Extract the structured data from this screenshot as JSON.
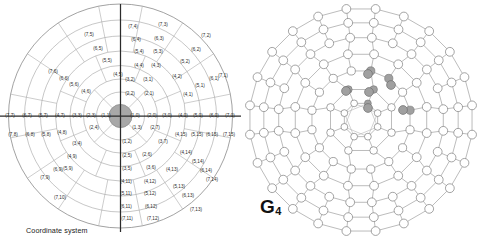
{
  "figure": {
    "panels": [
      {
        "id": "coordinate-system",
        "caption": "Coordinate system"
      },
      {
        "id": "graph",
        "caption": "G",
        "caption_sub": "4"
      }
    ]
  },
  "colors": {
    "background": "#ffffff",
    "stroke": "#6f6f6f",
    "stroke_light": "#bdbdbd",
    "axis": "#2b2b2b",
    "center_fill": "#a8a8a8",
    "node_fill": "#ffffff",
    "node_highlight": "#a0a0a0",
    "text": "#2b2b2b"
  },
  "coordinate_system": {
    "caption": "Coordinate system",
    "center_cell": "(0,0)",
    "ring_count": 7,
    "labels": [
      {
        "t": "(7,4)",
        "x": 133,
        "y": 27
      },
      {
        "t": "(7,3)",
        "x": 163,
        "y": 25
      },
      {
        "t": "(7,5)",
        "x": 89,
        "y": 35
      },
      {
        "t": "(7,2)",
        "x": 206,
        "y": 36
      },
      {
        "t": "(6,4)",
        "x": 136,
        "y": 40
      },
      {
        "t": "(6,3)",
        "x": 159,
        "y": 39
      },
      {
        "t": "(6,5)",
        "x": 98,
        "y": 49
      },
      {
        "t": "(6,2)",
        "x": 196,
        "y": 50
      },
      {
        "t": "(5,4)",
        "x": 139,
        "y": 52
      },
      {
        "t": "(5,3)",
        "x": 158,
        "y": 52
      },
      {
        "t": "(5,5)",
        "x": 107,
        "y": 61
      },
      {
        "t": "(5,2)",
        "x": 185,
        "y": 62
      },
      {
        "t": "(7,6)",
        "x": 53,
        "y": 72
      },
      {
        "t": "(7,1)",
        "x": 223,
        "y": 76
      },
      {
        "t": "(4,4)",
        "x": 139,
        "y": 66
      },
      {
        "t": "(4,3)",
        "x": 156,
        "y": 66
      },
      {
        "t": "(4,5)",
        "x": 118,
        "y": 75
      },
      {
        "t": "(4,2)",
        "x": 177,
        "y": 77
      },
      {
        "t": "(6,6)",
        "x": 64,
        "y": 79
      },
      {
        "t": "(6,1)",
        "x": 214,
        "y": 79
      },
      {
        "t": "(5,6)",
        "x": 74,
        "y": 85
      },
      {
        "t": "(5,1)",
        "x": 200,
        "y": 86
      },
      {
        "t": "(3,2)",
        "x": 130,
        "y": 80
      },
      {
        "t": "(3,1)",
        "x": 148,
        "y": 80
      },
      {
        "t": "(4,6)",
        "x": 86,
        "y": 92
      },
      {
        "t": "(4,1)",
        "x": 188,
        "y": 95
      },
      {
        "t": "(2,2)",
        "x": 130,
        "y": 94
      },
      {
        "t": "(2,1)",
        "x": 149,
        "y": 94
      },
      {
        "t": "(7,7)",
        "x": 10,
        "y": 116
      },
      {
        "t": "(6,7)",
        "x": 27,
        "y": 116
      },
      {
        "t": "(5,7)",
        "x": 43,
        "y": 116
      },
      {
        "t": "(4,7)",
        "x": 60,
        "y": 116
      },
      {
        "t": "(3,3)",
        "x": 77,
        "y": 116
      },
      {
        "t": "(2,3)",
        "x": 91,
        "y": 116
      },
      {
        "t": "(1,1)",
        "x": 106,
        "y": 116
      },
      {
        "t": "(1,0)",
        "x": 135,
        "y": 116
      },
      {
        "t": "(2,0)",
        "x": 152,
        "y": 116
      },
      {
        "t": "(3,0)",
        "x": 167,
        "y": 116
      },
      {
        "t": "(4,0)",
        "x": 183,
        "y": 116
      },
      {
        "t": "(5,0)",
        "x": 198,
        "y": 116
      },
      {
        "t": "(6,0)",
        "x": 214,
        "y": 116
      },
      {
        "t": "(7,0)",
        "x": 230,
        "y": 116
      },
      {
        "t": "(7,8)",
        "x": 13,
        "y": 135
      },
      {
        "t": "(6,8)",
        "x": 30,
        "y": 135
      },
      {
        "t": "(5,8)",
        "x": 46,
        "y": 135
      },
      {
        "t": "(4,8)",
        "x": 62,
        "y": 133
      },
      {
        "t": "(2,4)",
        "x": 94,
        "y": 128
      },
      {
        "t": "(1,3)",
        "x": 137,
        "y": 128
      },
      {
        "t": "(2,7)",
        "x": 155,
        "y": 128
      },
      {
        "t": "(4,15)",
        "x": 181,
        "y": 135
      },
      {
        "t": "(5,15)",
        "x": 197,
        "y": 135
      },
      {
        "t": "(6,15)",
        "x": 212,
        "y": 135
      },
      {
        "t": "(7,15)",
        "x": 229,
        "y": 135
      },
      {
        "t": "(3,4)",
        "x": 77,
        "y": 144
      },
      {
        "t": "(1,2)",
        "x": 127,
        "y": 142
      },
      {
        "t": "(3,7)",
        "x": 163,
        "y": 142
      },
      {
        "t": "(2,5)",
        "x": 127,
        "y": 156
      },
      {
        "t": "(2,6)",
        "x": 147,
        "y": 155
      },
      {
        "t": "(4,9)",
        "x": 72,
        "y": 157
      },
      {
        "t": "(4,14)",
        "x": 186,
        "y": 153
      },
      {
        "t": "(5,14)",
        "x": 198,
        "y": 162
      },
      {
        "t": "(3,5)",
        "x": 127,
        "y": 169
      },
      {
        "t": "(3,6)",
        "x": 151,
        "y": 168
      },
      {
        "t": "(6,9)",
        "x": 58,
        "y": 170
      },
      {
        "t": "(5,9)",
        "x": 68,
        "y": 169
      },
      {
        "t": "(6,14)",
        "x": 206,
        "y": 171
      },
      {
        "t": "(7,9)",
        "x": 45,
        "y": 178
      },
      {
        "t": "(7,14)",
        "x": 212,
        "y": 180
      },
      {
        "t": "(4,11)",
        "x": 126,
        "y": 182
      },
      {
        "t": "(4,12)",
        "x": 150,
        "y": 182
      },
      {
        "t": "(4,13)",
        "x": 172,
        "y": 170
      },
      {
        "t": "(5,13)",
        "x": 179,
        "y": 187
      },
      {
        "t": "(5,11)",
        "x": 126,
        "y": 194
      },
      {
        "t": "(5,12)",
        "x": 150,
        "y": 194
      },
      {
        "t": "(6,13)",
        "x": 188,
        "y": 196
      },
      {
        "t": "(7,10)",
        "x": 60,
        "y": 198
      },
      {
        "t": "(6,11)",
        "x": 126,
        "y": 207
      },
      {
        "t": "(6,12)",
        "x": 151,
        "y": 207
      },
      {
        "t": "(7,13)",
        "x": 196,
        "y": 210
      },
      {
        "t": "(7,11)",
        "x": 127,
        "y": 219
      },
      {
        "t": "(7,12)",
        "x": 153,
        "y": 219
      }
    ]
  },
  "graph": {
    "caption": "G",
    "caption_sub": "4",
    "ring_count": 7,
    "highlighted_node_count": 6,
    "node_shape": "circle"
  }
}
